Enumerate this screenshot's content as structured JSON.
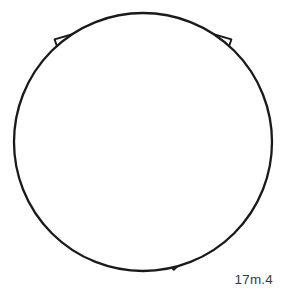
{
  "figure": {
    "caption": "17m.4",
    "background_color": "#ffffff",
    "line_color": "#1a1a1a",
    "fill_color": "#ffffff",
    "line_width": 1.9,
    "canvas": {
      "width": 287,
      "height": 294
    },
    "boundary": {
      "shape": "circle",
      "center_x": 143,
      "center_y": 142,
      "radius": 129
    },
    "fans": [
      {
        "name": "top-fan",
        "hub_x": 143,
        "hub_y": 14,
        "hub_radius": 23,
        "direction_degrees": 90,
        "sweep_degrees": 150,
        "ray_count": 9,
        "ring_radii": [
          23,
          66,
          92
        ],
        "ring_count": 2
      },
      {
        "name": "lower-left-fan",
        "hub_x": 53,
        "hub_y": 196,
        "hub_radius": 23,
        "direction_degrees": 330,
        "sweep_degrees": 150,
        "ray_count": 9,
        "ring_radii": [
          23,
          66,
          92
        ],
        "ring_count": 2
      },
      {
        "name": "lower-right-fan",
        "hub_x": 240,
        "hub_y": 206,
        "hub_radius": 23,
        "direction_degrees": 210,
        "sweep_degrees": 150,
        "ray_count": 9,
        "ring_radii": [
          23,
          66,
          92
        ],
        "ring_count": 2
      }
    ],
    "central_junction": {
      "shape": "triangle",
      "center_x": 145,
      "center_y": 143,
      "radius": 11
    },
    "field": {
      "description": "Interstitial field of rectangular and wedge tesserae filling space between the three fans and the circle boundary",
      "band_radii": [
        92,
        110,
        129
      ],
      "sector_count": 3
    }
  }
}
